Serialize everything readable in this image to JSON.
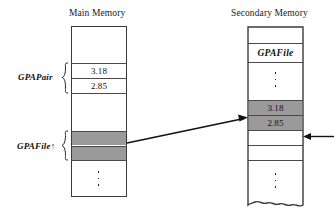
{
  "diagram": {
    "main_memory": {
      "title": "Main Memory",
      "cells": [
        {
          "text": "",
          "shaded": false
        },
        {
          "text": "3.18",
          "shaded": false
        },
        {
          "text": "2.85",
          "shaded": false
        },
        {
          "text": "",
          "shaded": false
        },
        {
          "text": "",
          "shaded": true
        },
        {
          "text": "",
          "shaded": true
        },
        {
          "text": "",
          "shaded": false
        }
      ],
      "ellipsis": "⋮",
      "labels": {
        "gpa_pair": "GPAPair",
        "gpa_file": "GPAFile↑"
      }
    },
    "secondary_memory": {
      "title": "Secondary Memory",
      "cells": [
        {
          "text": "",
          "shaded": false
        },
        {
          "text": "GPAFile",
          "shaded": false,
          "italic": true
        },
        {
          "text": "",
          "shaded": false
        },
        {
          "text": "3.18",
          "shaded": true
        },
        {
          "text": "2.85",
          "shaded": true
        },
        {
          "text": "",
          "shaded": false
        },
        {
          "text": "",
          "shaded": false
        },
        {
          "text": "",
          "shaded": false
        }
      ],
      "ellipsis_upper": "⋮",
      "ellipsis_lower": "⋮"
    },
    "arrows": {
      "file_pointer_arrow": "pointer-from-main-to-secondary",
      "file_position_arrow": "current-file-position-marker"
    },
    "colors": {
      "shade": "#9a9a9a",
      "stroke": "#3a3a3a",
      "text": "#111111"
    }
  }
}
